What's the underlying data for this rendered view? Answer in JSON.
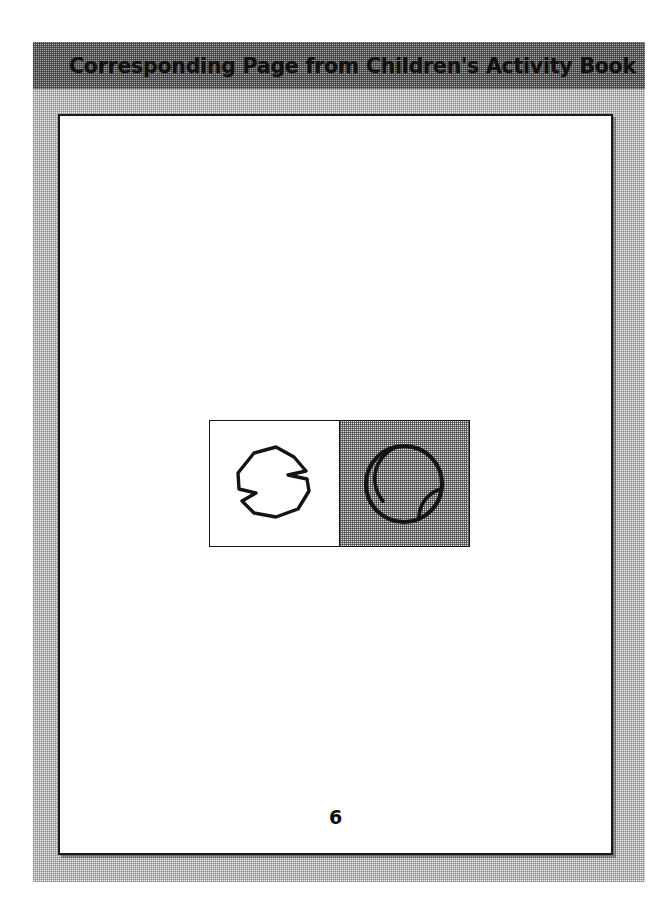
{
  "header": {
    "title": "Corresponding Page from Children's Activity Book",
    "band_color": "#9a9a9a",
    "text_color": "#111111"
  },
  "frame": {
    "texture": "halftone-dither",
    "color": "#f2f2f2"
  },
  "page": {
    "background": "#ffffff",
    "border_color": "#1a1a1a",
    "page_number": "6"
  },
  "illustration": {
    "border_color": "#141414",
    "panels": [
      {
        "name": "blob-panel",
        "background": "#ffffff",
        "shape": "irregular-polygon-blob",
        "shape_label": "blob"
      },
      {
        "name": "ball-panel",
        "background": "#e3e3e3",
        "texture": "halftone-dither",
        "shape": "ball-with-seams",
        "shape_label": "ball"
      }
    ]
  }
}
